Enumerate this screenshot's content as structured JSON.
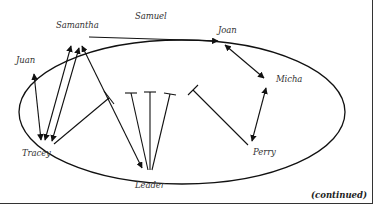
{
  "diagram": {
    "type": "sociogram",
    "nodes": [
      {
        "id": "samuel",
        "label": "Samuel"
      },
      {
        "id": "samantha",
        "label": "Samantha"
      },
      {
        "id": "joan",
        "label": "Joan"
      },
      {
        "id": "juan",
        "label": "Juan"
      },
      {
        "id": "micha",
        "label": "Micha"
      },
      {
        "id": "tracey",
        "label": "Tracey"
      },
      {
        "id": "perry",
        "label": "Perry"
      },
      {
        "id": "leader",
        "label": "Leader"
      }
    ],
    "edges": [
      {
        "from": "samantha",
        "to": "joan",
        "kind": "arrow"
      },
      {
        "from": "joan",
        "to": "micha",
        "kind": "double-arrow"
      },
      {
        "from": "perry",
        "to": "micha",
        "kind": "arrow"
      },
      {
        "from": "juan",
        "to": "tracey",
        "kind": "double-arrow"
      },
      {
        "from": "tracey",
        "to": "samantha",
        "kind": "double-arrow"
      },
      {
        "from": "tracey",
        "to": "samantha",
        "kind": "double-arrow"
      },
      {
        "from": "tracey",
        "to": "blocked",
        "kind": "blocked"
      },
      {
        "from": "leader",
        "to": "samantha",
        "kind": "double-arrow"
      },
      {
        "from": "leader",
        "to": "blocked",
        "kind": "blocked"
      },
      {
        "from": "leader",
        "to": "blocked",
        "kind": "blocked"
      },
      {
        "from": "leader",
        "to": "blocked",
        "kind": "blocked"
      },
      {
        "from": "perry",
        "to": "blocked",
        "kind": "blocked"
      }
    ],
    "footer": "(continued)"
  }
}
